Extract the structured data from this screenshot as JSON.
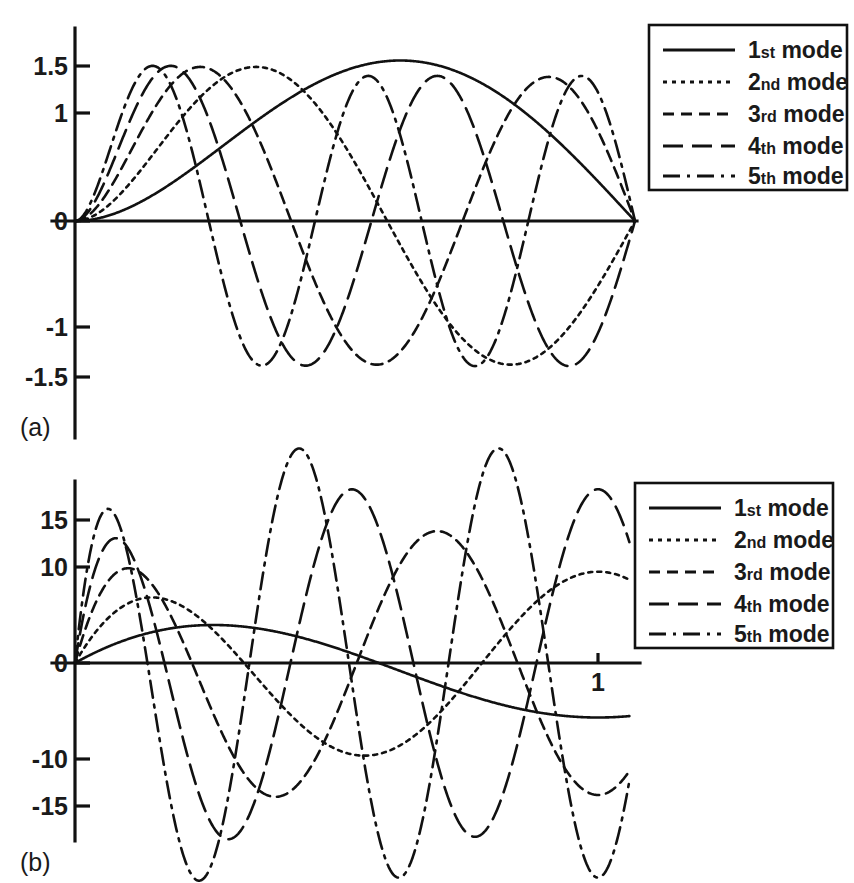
{
  "figure": {
    "panels": [
      {
        "id": "a",
        "label": "(a)",
        "description": "Mode shapes of a clamped-pinned beam"
      },
      {
        "id": "b",
        "label": "(b)",
        "description": "Slope (first derivative) of the mode shapes"
      }
    ]
  },
  "legend": {
    "entries": [
      {
        "ordinal_number": "1",
        "ordinal_suffix": "st",
        "label": "mode",
        "style": "solid",
        "dash": "none"
      },
      {
        "ordinal_number": "2",
        "ordinal_suffix": "nd",
        "label": "mode",
        "style": "dotted",
        "dash": "4,5"
      },
      {
        "ordinal_number": "3",
        "ordinal_suffix": "rd",
        "label": "mode",
        "style": "short-dashed",
        "dash": "11,7"
      },
      {
        "ordinal_number": "4",
        "ordinal_suffix": "th",
        "label": "mode",
        "style": "long-dashed",
        "dash": "20,9"
      },
      {
        "ordinal_number": "5",
        "ordinal_suffix": "th",
        "label": "mode",
        "style": "dash-dot",
        "dash": "17,7,3,7"
      }
    ]
  },
  "chart_data": [
    {
      "id": "a",
      "type": "line",
      "title": "",
      "xlabel": "",
      "ylabel": "",
      "xlim": [
        0,
        1
      ],
      "ylim": [
        -1.85,
        1.75
      ],
      "grid": false,
      "legend_position": "top-right",
      "ytick_labels": [
        "1.5",
        "1",
        "0",
        "-1",
        "-1.5"
      ],
      "ytick_values": [
        1.5,
        1,
        0,
        -1,
        -1.5
      ],
      "xtick_labels": [],
      "xtick_values": [],
      "series": [
        {
          "name": "1st mode",
          "beta": 3.9266,
          "sigma": 1.0008,
          "amplitude": 1.5,
          "peak_value": 1.5,
          "peak_x": 0.62,
          "end_value": 0.0,
          "nodes": 0
        },
        {
          "name": "2nd mode",
          "beta": 7.0686,
          "sigma": 1.0,
          "amplitude": 1.44,
          "peak_value": 1.44,
          "peak_x": 0.355,
          "trough_value": -1.4,
          "end_value": 0.0,
          "nodes": 1
        },
        {
          "name": "3rd mode",
          "beta": 10.2102,
          "sigma": 1.0,
          "amplitude": 1.44,
          "peak_value": 1.44,
          "peak_x": 0.245,
          "trough_value": -1.4,
          "end_value": 0.0,
          "nodes": 2
        },
        {
          "name": "4th mode",
          "beta": 13.3518,
          "sigma": 1.0,
          "amplitude": 1.45,
          "peak_value": 1.45,
          "peak_x": 0.188,
          "trough_value": -1.4,
          "end_value": 0.0,
          "nodes": 3
        },
        {
          "name": "5th mode",
          "beta": 16.4934,
          "sigma": 1.0,
          "amplitude": 1.45,
          "peak_value": 1.45,
          "peak_x": 0.152,
          "trough_value": -1.4,
          "end_value": 0.0,
          "nodes": 4
        }
      ]
    },
    {
      "id": "b",
      "type": "line",
      "title": "",
      "xlabel": "",
      "ylabel": "",
      "xlim": [
        0,
        1.1
      ],
      "ylim": [
        -18,
        18
      ],
      "grid": false,
      "legend_position": "top-right",
      "ytick_labels": [
        "15",
        "10",
        "0",
        "-10",
        "-15"
      ],
      "ytick_values": [
        15,
        10,
        0,
        -10,
        -15
      ],
      "xtick_labels": [
        "1"
      ],
      "xtick_values": [
        1
      ],
      "series": [
        {
          "name": "1st mode",
          "peak_value": 4.6,
          "peak_x": 0.3,
          "end_value": -4.8,
          "zero_crossings": 1
        },
        {
          "name": "2nd mode",
          "peak_value": 6.6,
          "peak_x": 0.175,
          "trough_value": -10.5,
          "end_value": 9.6,
          "zero_crossings": 2
        },
        {
          "name": "3rd mode",
          "peak_value": 8.3,
          "peak_x": 0.118,
          "trough_value": -13.5,
          "end_value": 14.6,
          "zero_crossings": 3
        },
        {
          "name": "4th mode",
          "peak_value": 9.0,
          "peak_x": 0.09,
          "trough_value": -14.7,
          "end_value": -15.4,
          "zero_crossings": 4
        },
        {
          "name": "5th mode",
          "peak_value": 9.3,
          "peak_x": 0.073,
          "trough_value": -15.8,
          "end_value": -15.6,
          "zero_crossings": 5
        }
      ]
    }
  ]
}
